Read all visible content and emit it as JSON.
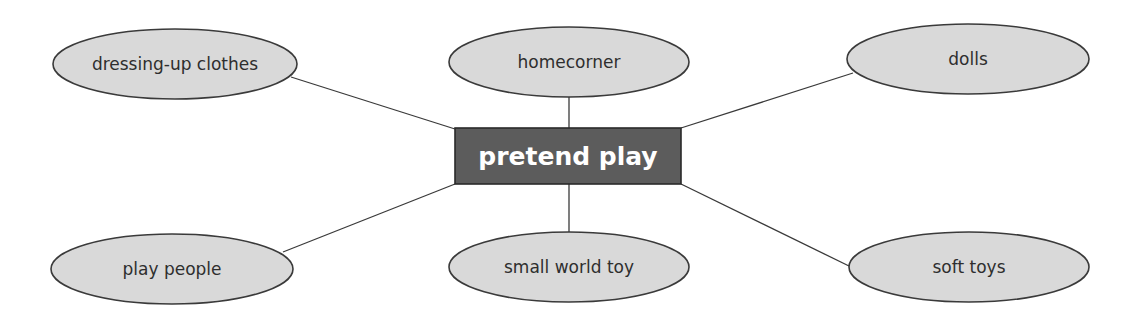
{
  "diagram": {
    "type": "mind-map",
    "center": {
      "label": "pretend play",
      "fill": "#5c5c5c",
      "text_color": "#ffffff"
    },
    "nodes": [
      {
        "id": "dressing-up-clothes",
        "label": "dressing-up clothes",
        "position": "top-left"
      },
      {
        "id": "homecorner",
        "label": "homecorner",
        "position": "top-center"
      },
      {
        "id": "dolls",
        "label": "dolls",
        "position": "top-right"
      },
      {
        "id": "play-people",
        "label": "play people",
        "position": "bottom-left"
      },
      {
        "id": "small-world-toy",
        "label": "small world toy",
        "position": "bottom-center"
      },
      {
        "id": "soft-toys",
        "label": "soft toys",
        "position": "bottom-right"
      }
    ],
    "node_fill": "#d9d9d9",
    "line_color": "#3a3a3a"
  }
}
